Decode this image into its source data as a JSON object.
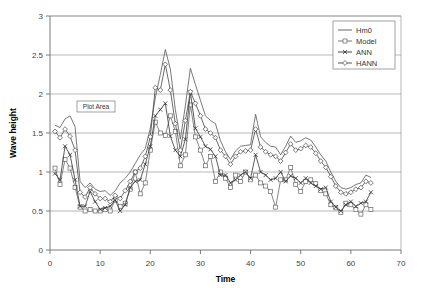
{
  "chart_data": {
    "type": "line",
    "title": "",
    "xlabel": "Time",
    "ylabel": "Wave height",
    "xlim": [
      0,
      70
    ],
    "ylim": [
      0,
      3
    ],
    "xticks": [
      0,
      10,
      20,
      30,
      40,
      50,
      60,
      70
    ],
    "yticks": [
      0,
      0.5,
      1,
      1.5,
      2,
      2.5,
      3
    ],
    "xtick_labels": [
      "0",
      "10",
      "20",
      "30",
      "40",
      "50",
      "60",
      "70"
    ],
    "ytick_labels": [
      "0",
      "0.5",
      "1",
      "1.5",
      "2",
      "2.5",
      "3"
    ],
    "grid": "horizontal",
    "legend_position": "top-right-inside",
    "x": [
      1,
      2,
      3,
      4,
      5,
      6,
      7,
      8,
      9,
      10,
      11,
      12,
      13,
      14,
      15,
      16,
      17,
      18,
      19,
      20,
      21,
      22,
      23,
      24,
      25,
      26,
      27,
      28,
      29,
      30,
      31,
      32,
      33,
      34,
      35,
      36,
      37,
      38,
      39,
      40,
      41,
      42,
      43,
      44,
      45,
      46,
      47,
      48,
      49,
      50,
      51,
      52,
      53,
      54,
      55,
      56,
      57,
      58,
      59,
      60,
      61,
      62,
      63,
      64
    ],
    "series": [
      {
        "name": "Hm0",
        "marker": "none",
        "color": "#555555",
        "values": [
          1.6,
          1.57,
          1.68,
          1.72,
          1.58,
          0.88,
          0.8,
          0.86,
          0.78,
          0.75,
          0.76,
          0.7,
          0.76,
          0.86,
          0.92,
          1.0,
          1.11,
          1.22,
          1.3,
          1.56,
          1.95,
          2.25,
          2.57,
          2.32,
          1.8,
          1.42,
          1.85,
          2.33,
          2.12,
          1.92,
          1.72,
          1.66,
          1.62,
          1.4,
          1.26,
          1.16,
          1.27,
          1.33,
          1.34,
          1.35,
          1.74,
          1.45,
          1.38,
          1.33,
          1.32,
          1.22,
          1.33,
          1.46,
          1.38,
          1.4,
          1.44,
          1.41,
          1.32,
          1.22,
          1.14,
          1.0,
          0.88,
          0.8,
          0.78,
          0.8,
          0.84,
          0.86,
          0.96,
          0.93
        ]
      },
      {
        "name": "Model",
        "marker": "square",
        "color": "#666666",
        "values": [
          1.05,
          0.84,
          1.16,
          1.05,
          0.8,
          0.55,
          0.5,
          0.52,
          0.5,
          0.5,
          0.52,
          0.5,
          0.64,
          0.56,
          0.6,
          0.78,
          1.0,
          0.72,
          0.86,
          1.28,
          1.64,
          1.5,
          1.47,
          1.72,
          1.52,
          1.08,
          1.22,
          1.86,
          1.45,
          1.28,
          1.08,
          1.2,
          0.88,
          1.0,
          0.92,
          0.8,
          0.96,
          0.88,
          1.0,
          0.9,
          0.96,
          0.86,
          0.82,
          0.75,
          0.55,
          0.9,
          0.9,
          1.06,
          0.84,
          0.75,
          0.88,
          0.9,
          0.85,
          0.76,
          0.72,
          0.58,
          0.54,
          0.48,
          0.6,
          0.58,
          0.52,
          0.46,
          0.58,
          0.52
        ]
      },
      {
        "name": "ANN",
        "marker": "x",
        "color": "#333333",
        "values": [
          0.98,
          0.9,
          1.33,
          1.22,
          0.9,
          0.56,
          0.56,
          0.75,
          0.62,
          0.52,
          0.54,
          0.56,
          0.64,
          0.5,
          0.58,
          0.8,
          0.88,
          0.9,
          1.1,
          1.33,
          1.72,
          1.8,
          1.88,
          1.46,
          1.28,
          1.2,
          1.42,
          2.02,
          1.56,
          1.45,
          1.33,
          1.29,
          1.2,
          0.96,
          0.96,
          0.86,
          0.9,
          0.96,
          1.0,
          0.92,
          1.22,
          1.0,
          0.96,
          0.9,
          0.92,
          1.0,
          0.88,
          0.95,
          0.92,
          0.86,
          0.92,
          0.86,
          0.82,
          0.78,
          0.8,
          0.62,
          0.55,
          0.5,
          0.58,
          0.62,
          0.56,
          0.6,
          0.62,
          0.74
        ]
      },
      {
        "name": "HANN",
        "marker": "diamond",
        "color": "#444444",
        "values": [
          1.52,
          1.44,
          1.55,
          1.46,
          1.28,
          0.74,
          0.68,
          0.8,
          0.72,
          0.66,
          0.66,
          0.62,
          0.7,
          0.66,
          0.76,
          0.88,
          1.0,
          1.05,
          1.2,
          1.45,
          2.08,
          2.05,
          2.38,
          2.05,
          1.62,
          1.28,
          1.66,
          2.03,
          1.88,
          1.72,
          1.55,
          1.5,
          1.44,
          1.28,
          1.2,
          1.1,
          1.2,
          1.26,
          1.27,
          1.28,
          1.55,
          1.32,
          1.26,
          1.22,
          1.2,
          1.14,
          1.25,
          1.36,
          1.28,
          1.3,
          1.34,
          1.32,
          1.24,
          1.14,
          1.06,
          0.94,
          0.82,
          0.74,
          0.72,
          0.74,
          0.78,
          0.8,
          0.88,
          0.86
        ]
      }
    ]
  },
  "annotations": {
    "plot_area_tooltip": "Plot Area"
  },
  "legend": {
    "entries": [
      "Hm0",
      "Model",
      "ANN",
      "HANN"
    ]
  },
  "axes": {
    "x_title": "Time",
    "y_title": "Wave height"
  },
  "colors": {
    "background": "#ffffff",
    "gridline": "#9a9a9a",
    "axis": "#7a7a7a",
    "text": "#333333"
  }
}
